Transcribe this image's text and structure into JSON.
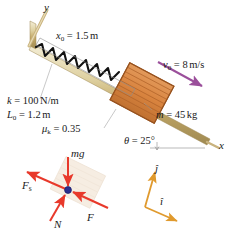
{
  "figure": {
    "axes": {
      "y_label": "y",
      "x_label": "x"
    },
    "labels": {
      "x0": {
        "symbol": "x",
        "subscript": "0",
        "equals": "=",
        "value": "1.5",
        "unit": "m"
      },
      "k": {
        "symbol": "k",
        "equals": "=",
        "value": "100",
        "unit": "N/m"
      },
      "L0": {
        "symbol": "L",
        "subscript": "0",
        "equals": "=",
        "value": "1.2",
        "unit": "m"
      },
      "mu_k": {
        "symbol": "μ",
        "subscript": "k",
        "equals": "=",
        "value": "0.35",
        "unit": ""
      },
      "v0": {
        "symbol": "v",
        "subscript": "0",
        "equals": "=",
        "value": "8",
        "unit": "m/s"
      },
      "m": {
        "symbol": "m",
        "equals": "=",
        "value": "45",
        "unit": "kg"
      },
      "theta": {
        "symbol": "θ",
        "equals": "=",
        "value": "25",
        "unit": "°"
      }
    },
    "free_body": {
      "forces": [
        {
          "name": "mg",
          "label": "mg",
          "direction": "down"
        },
        {
          "name": "Fs",
          "label": "F",
          "subscript": "s",
          "direction": "up-left"
        },
        {
          "name": "N",
          "label": "N",
          "direction": "up-right"
        },
        {
          "name": "F",
          "label": "F",
          "direction": "up-left-along-incline"
        }
      ]
    },
    "unit_vectors": {
      "j": "ĵ",
      "i": "î"
    },
    "colors": {
      "incline": "#c9b37e",
      "incline_light": "#e3d8b4",
      "crate": "#d9843f",
      "crate_dark": "#b0632a",
      "spring": "#111111",
      "velocity_arrow": "#9b4f9b",
      "force_arrow": "#e8392b",
      "unit_vector": "#e09a2e",
      "dot": "#2b2f8f",
      "leader": "#9a9a9a"
    }
  }
}
